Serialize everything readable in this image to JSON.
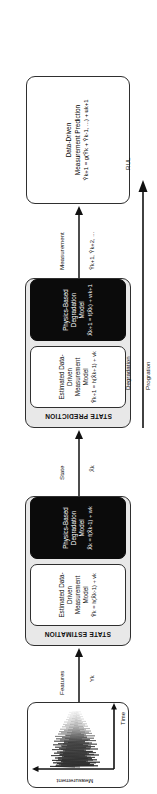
{
  "diagram": {
    "orientation": "rotated-90-ccw",
    "accent_dark": "#0b0b0b",
    "accent_group": "#e8e8e8",
    "stroke": "#2f2f2f"
  },
  "signal_plot": {
    "name": "raw-measurement-signal-plot",
    "y_axis_label": "Measurement",
    "x_axis_label": "Time"
  },
  "state_estimation": {
    "title": "STATE ESTIMATION",
    "measurement_model": {
      "line1": "Estimated Data-Driven",
      "line2": "Measurement Model",
      "equation": "Ŷk = h(X̂k-1) + vk"
    },
    "degradation_model": {
      "line1": "Physics-Based",
      "line2": "Degradation Model",
      "equation": "X̂k = f(X̂k-1) + wk"
    }
  },
  "state_prediction": {
    "title": "STATE PREDICTION",
    "measurement_model": {
      "line1": "Estimated Data-Driven",
      "line2": "Measurement Model",
      "equation": "Ŷk+1 = h(X̂k+1) + vk"
    },
    "degradation_model": {
      "line1": "Physics-Based",
      "line2": "Degradation Model",
      "equation": "X̂k+1 = f(X̂k) + wk+1"
    }
  },
  "measurement_prediction": {
    "line1": "Data-Driven",
    "line2": "Measurement Prediction",
    "equation": "Ŷk+1 = g(Ŷk + Ŷk-1, ...) + uk+1"
  },
  "connectors": {
    "features": {
      "label": "Features",
      "symbol": "Yk"
    },
    "state": {
      "label": "State",
      "symbol": "X̂k"
    },
    "measurement": {
      "label": "Measurement",
      "symbol": "Ŷk+1, Ŷk+2, ..."
    },
    "degradation": {
      "label": "Degradation"
    },
    "progression": {
      "label": "Progration"
    },
    "rul": {
      "label": "RUL"
    }
  }
}
